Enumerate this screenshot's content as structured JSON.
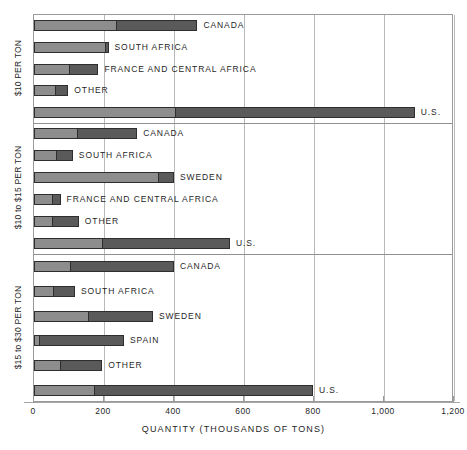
{
  "chart_data": {
    "type": "bar",
    "orientation": "horizontal",
    "stacked": true,
    "title": "",
    "xlabel": "QUANTITY (THOUSANDS OF TONS)",
    "ylabel": "",
    "xlim": [
      0,
      1200
    ],
    "xticks": [
      0,
      200,
      400,
      600,
      800,
      1000,
      1200
    ],
    "xticklabels": [
      "0",
      "200",
      "400",
      "600",
      "800",
      "1,000",
      "1,200"
    ],
    "grid": true,
    "legend": "none",
    "series": [
      {
        "name": "lower-segment",
        "color": "#8d8d8d"
      },
      {
        "name": "upper-segment",
        "color": "#5a5a5a"
      }
    ],
    "panels": [
      {
        "group_label": "$10 PER TON",
        "bars": [
          {
            "label": "CANADA",
            "light": 230,
            "dark": 237,
            "total": 467
          },
          {
            "label": "SOUTH AFRICA",
            "light": 200,
            "dark": 13,
            "total": 213
          },
          {
            "label": "FRANCE AND CENTRAL AFRICA",
            "light": 97,
            "dark": 87,
            "total": 184
          },
          {
            "label": "OTHER",
            "light": 58,
            "dark": 40,
            "total": 98
          },
          {
            "label": "U.S.",
            "light": 400,
            "dark": 688,
            "total": 1088
          }
        ]
      },
      {
        "group_label": "$10 to $15 PER TON",
        "bars": [
          {
            "label": "CANADA",
            "light": 120,
            "dark": 175,
            "total": 295
          },
          {
            "label": "SOUTH AFRICA",
            "light": 59,
            "dark": 52,
            "total": 111
          },
          {
            "label": "SWEDEN",
            "light": 350,
            "dark": 50,
            "total": 400
          },
          {
            "label": "FRANCE AND CENTRAL AFRICA",
            "light": 49,
            "dark": 27,
            "total": 76
          },
          {
            "label": "OTHER",
            "light": 48,
            "dark": 80,
            "total": 128
          },
          {
            "label": "U.S.",
            "light": 190,
            "dark": 370,
            "total": 560
          }
        ]
      },
      {
        "group_label": "$15 to $30 PER TON",
        "bars": [
          {
            "label": "CANADA",
            "light": 100,
            "dark": 300,
            "total": 400
          },
          {
            "label": "SOUTH AFRICA",
            "light": 52,
            "dark": 65,
            "total": 117
          },
          {
            "label": "SWEDEN",
            "light": 150,
            "dark": 190,
            "total": 340
          },
          {
            "label": "SPAIN",
            "light": 12,
            "dark": 245,
            "total": 257
          },
          {
            "label": "OTHER",
            "light": 70,
            "dark": 125,
            "total": 195
          },
          {
            "label": "U.S.",
            "light": 168,
            "dark": 629,
            "total": 797
          }
        ]
      }
    ]
  }
}
